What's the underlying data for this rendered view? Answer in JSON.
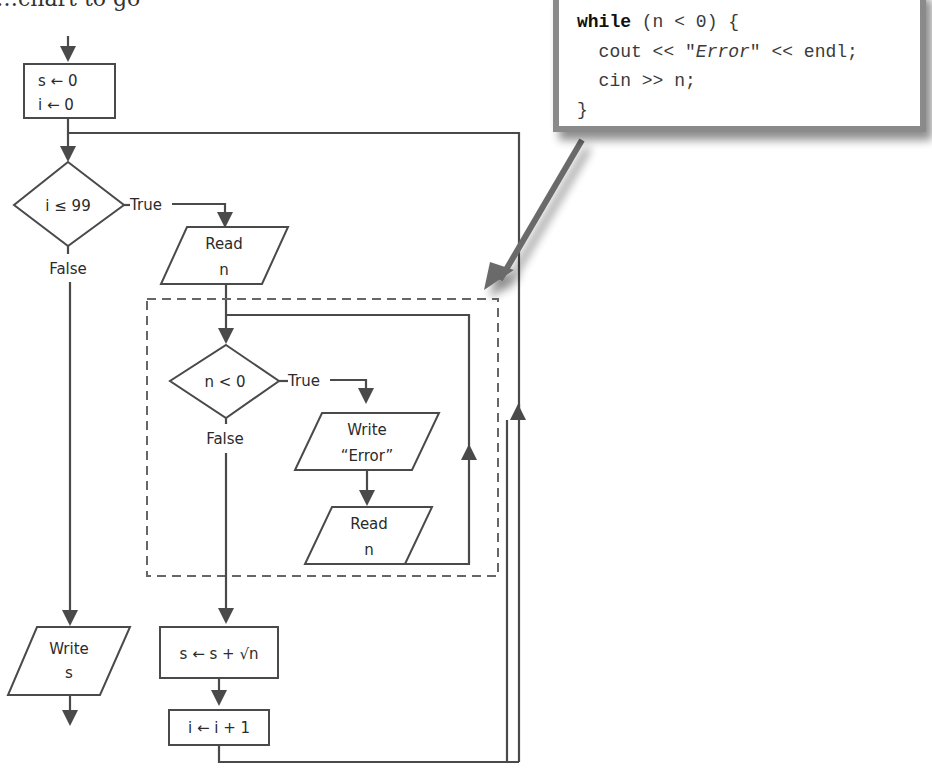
{
  "heading_fragment": "…chart to go",
  "flowchart": {
    "init_block": {
      "line1": "s ← 0",
      "line2": "i ← 0"
    },
    "outer_decision": {
      "label": "i ≤ 99",
      "true_label": "True",
      "false_label": "False"
    },
    "read_n_outer": {
      "line1": "Read",
      "line2": "n"
    },
    "inner_decision": {
      "label": "n < 0",
      "true_label": "True",
      "false_label": "False"
    },
    "write_error": {
      "line1": "Write",
      "line2": "“Error”"
    },
    "read_n_inner": {
      "line1": "Read",
      "line2": "n"
    },
    "sum_block": {
      "label": "s ← s + √n"
    },
    "increment_block": {
      "label": "i ← i + 1"
    },
    "write_s": {
      "line1": "Write",
      "line2": "s"
    }
  },
  "code_callout": {
    "keyword": "while",
    "line1_rest": " (n < 0) {",
    "line2_pre": "  cout << \"",
    "line2_italic": "Error",
    "line2_post": "\" << endl;",
    "line3": "  cin >> n;",
    "line4": "}"
  },
  "colors": {
    "line": "#4a4a4a",
    "callout_border": "#8a8a8a",
    "dashed_region": "#666666"
  }
}
